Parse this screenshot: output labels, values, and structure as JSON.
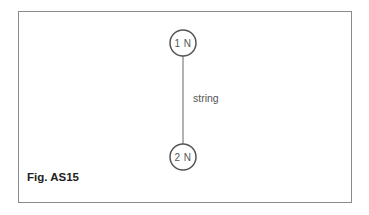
{
  "figure": {
    "caption": "Fig. AS15",
    "nodes": [
      {
        "id": "top",
        "label": "1 N"
      },
      {
        "id": "bottom",
        "label": "2 N"
      }
    ],
    "connector": {
      "label": "string"
    },
    "colors": {
      "border": "#8a8a8a",
      "node_stroke": "#555555",
      "line": "#888888",
      "text": "#555555",
      "caption": "#222222"
    }
  }
}
